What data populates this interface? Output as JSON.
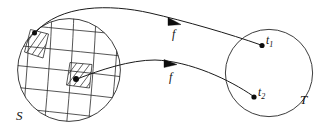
{
  "figure": {
    "type": "mathematical-mapping-diagram",
    "background_color": "#ffffff",
    "ink_color": "#1a1a1a",
    "width": 328,
    "height": 139
  },
  "source_domain": {
    "label": "S",
    "shape": "circle",
    "center": [
      69,
      70
    ],
    "radius": 52,
    "grid": {
      "description": "curvilinear coordinate grid",
      "u_lines": 6,
      "v_lines": 6
    },
    "highlighted_cells": [
      {
        "name": "cell-1",
        "fill": "diagonal-hatch",
        "marked_point_label": ""
      },
      {
        "name": "cell-2",
        "fill": "diagonal-hatch",
        "marked_point_label": ""
      }
    ],
    "points": [
      {
        "name": "source-point-1",
        "label": "",
        "position": [
          34,
          33
        ]
      },
      {
        "name": "source-point-2",
        "label": "",
        "position": [
          75,
          79
        ]
      }
    ]
  },
  "target_domain": {
    "label": "T",
    "shape": "circle",
    "center": [
      269,
      73
    ],
    "radius": 44,
    "points": [
      {
        "name": "target-point-1",
        "label": "t",
        "subscript": "1",
        "position": [
          262,
          45
        ]
      },
      {
        "name": "target-point-2",
        "label": "t",
        "subscript": "2",
        "position": [
          254,
          97
        ]
      }
    ]
  },
  "maps": [
    {
      "name": "map-arrow-upper",
      "label": "f",
      "from": "source-point-1",
      "to": "target-point-1",
      "arrowhead_at": [
        176,
        22
      ]
    },
    {
      "name": "map-arrow-lower",
      "label": "f",
      "from": "source-point-2",
      "to": "target-point-2",
      "arrowhead_at": [
        172,
        68
      ]
    }
  ],
  "labels": {
    "source_set": "S",
    "target_set": "T",
    "map_upper": "f",
    "map_lower": "f",
    "target_point_1_base": "t",
    "target_point_1_sub": "1",
    "target_point_2_base": "t",
    "target_point_2_sub": "2"
  }
}
